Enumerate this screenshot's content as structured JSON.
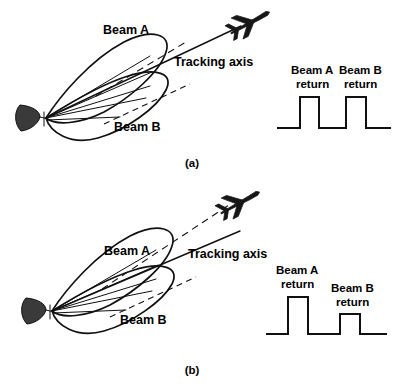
{
  "figure": {
    "ink_color": "#111111",
    "background_color": "#ffffff"
  },
  "panels": [
    {
      "id": "a",
      "caption": "(a)",
      "beam_a_label": "Beam A",
      "beam_b_label": "Beam B",
      "axis_label": "Tracking axis",
      "target_icon": "aircraft-icon",
      "antenna_icon": "parabolic-dish-icon",
      "target_on_axis": true,
      "pulses": {
        "beam_a_label_line1": "Beam A",
        "beam_a_label_line2": "return",
        "beam_b_label_line1": "Beam B",
        "beam_b_label_line2": "return",
        "beam_a_amplitude": 1.0,
        "beam_b_amplitude": 1.0,
        "amplitudes_equal": true
      }
    },
    {
      "id": "b",
      "caption": "(b)",
      "beam_a_label": "Beam A",
      "beam_b_label": "Beam B",
      "axis_label": "Tracking axis",
      "target_icon": "aircraft-icon",
      "antenna_icon": "parabolic-dish-icon",
      "target_on_axis": false,
      "pulses": {
        "beam_a_label_line1": "Beam A",
        "beam_a_label_line2": "return",
        "beam_b_label_line1": "Beam B",
        "beam_b_label_line2": "return",
        "beam_a_amplitude": 1.0,
        "beam_b_amplitude": 0.55,
        "amplitudes_equal": false
      }
    }
  ]
}
